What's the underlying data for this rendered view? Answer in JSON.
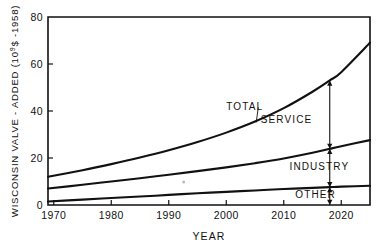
{
  "chart_data": {
    "type": "area",
    "title": "",
    "xlabel": "YEAR",
    "ylabel": "WISCONSIN VALVE - ADDED (10⁹$ -1958)",
    "ylabel_parts": {
      "prefix": "WISCONSIN  VALVE - ADDED (10",
      "exponent": "9",
      "suffix": "$ -1958)"
    },
    "xlim": [
      1969,
      2025
    ],
    "ylim": [
      0,
      80
    ],
    "grid": false,
    "legend_position": "inline-annotations",
    "xticks": [
      1970,
      1980,
      1990,
      2000,
      2010,
      2020
    ],
    "xtick_labels": [
      "1970",
      "1980",
      "1990",
      "2000",
      "2010",
      "2020"
    ],
    "yticks": [
      0,
      20,
      40,
      60,
      80
    ],
    "ytick_labels": [
      "0",
      "20",
      "40",
      "60",
      "80"
    ],
    "x": [
      1969,
      1975,
      1980,
      1985,
      1990,
      1995,
      2000,
      2005,
      2010,
      2015,
      2018,
      2020,
      2025
    ],
    "series": [
      {
        "name": "OTHER",
        "kind": "cumulative-boundary",
        "values": [
          1.5,
          2.3,
          3.0,
          3.6,
          4.3,
          5.0,
          5.6,
          6.2,
          6.8,
          7.3,
          7.6,
          7.8,
          8.2
        ]
      },
      {
        "name": "INDUSTRY",
        "kind": "cumulative-boundary",
        "values": [
          7.0,
          8.6,
          10.0,
          11.4,
          12.9,
          14.4,
          16.0,
          17.8,
          19.8,
          22.2,
          23.9,
          25.0,
          27.6
        ]
      },
      {
        "name": "TOTAL",
        "kind": "cumulative-boundary",
        "values": [
          12.0,
          14.8,
          17.4,
          20.2,
          23.3,
          26.8,
          30.8,
          35.5,
          41.2,
          48.2,
          53.0,
          56.5,
          69.0
        ]
      }
    ],
    "band_labels": [
      "TOTAL",
      "SERVICE",
      "INDUSTRY",
      "OTHER"
    ],
    "annotations": [
      {
        "name": "total-leader-label",
        "text": "TOTAL",
        "x": 2000,
        "y": 40.5
      },
      {
        "name": "service-band-label",
        "text": "SERVICE",
        "x": 2006,
        "y": 35.0
      },
      {
        "name": "industry-band-label",
        "text": "INDUSTRY",
        "x": 2011,
        "y": 15.0
      },
      {
        "name": "other-band-label",
        "text": "OTHER",
        "x": 2012,
        "y": 3.2
      },
      {
        "name": "decomposition-arrow",
        "type": "double-arrow-stack",
        "x": 2018,
        "segments": [
          {
            "label": "SERVICE",
            "from": 23.9,
            "to": 53.0
          },
          {
            "label": "INDUSTRY",
            "from": 7.6,
            "to": 23.9
          },
          {
            "label": "OTHER",
            "from": 0.0,
            "to": 7.6
          }
        ]
      }
    ],
    "colors": {
      "ink": "#111111",
      "background": "#ffffff"
    }
  }
}
